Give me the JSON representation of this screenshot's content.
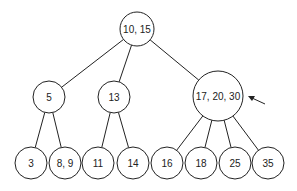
{
  "diagram": {
    "type": "2-3-4 tree",
    "nodes": [
      {
        "id": "root",
        "label": "10, 15",
        "cx": 137,
        "cy": 29,
        "r": 17
      },
      {
        "id": "n5",
        "label": "5",
        "cx": 49,
        "cy": 97,
        "r": 16
      },
      {
        "id": "n13",
        "label": "13",
        "cx": 114,
        "cy": 97,
        "r": 16
      },
      {
        "id": "n17",
        "label": "17, 20, 30",
        "cx": 218,
        "cy": 96,
        "r": 25
      },
      {
        "id": "l3",
        "label": "3",
        "cx": 31,
        "cy": 163,
        "r": 16
      },
      {
        "id": "l89",
        "label": "8, 9",
        "cx": 65,
        "cy": 163,
        "r": 16
      },
      {
        "id": "l11",
        "label": "11",
        "cx": 98,
        "cy": 163,
        "r": 16
      },
      {
        "id": "l14",
        "label": "14",
        "cx": 133,
        "cy": 163,
        "r": 16
      },
      {
        "id": "l16",
        "label": "16",
        "cx": 167,
        "cy": 163,
        "r": 16
      },
      {
        "id": "l18",
        "label": "18",
        "cx": 201,
        "cy": 163,
        "r": 16
      },
      {
        "id": "l25",
        "label": "25",
        "cx": 235,
        "cy": 163,
        "r": 16
      },
      {
        "id": "l35",
        "label": "35",
        "cx": 268,
        "cy": 163,
        "r": 16
      }
    ],
    "edges": [
      [
        "root",
        "n5"
      ],
      [
        "root",
        "n13"
      ],
      [
        "root",
        "n17"
      ],
      [
        "n5",
        "l3"
      ],
      [
        "n5",
        "l89"
      ],
      [
        "n13",
        "l11"
      ],
      [
        "n13",
        "l14"
      ],
      [
        "n17",
        "l16"
      ],
      [
        "n17",
        "l18"
      ],
      [
        "n17",
        "l25"
      ],
      [
        "n17",
        "l35"
      ]
    ],
    "arrow": {
      "points_to": "n17",
      "from": [
        265,
        104
      ],
      "to": [
        248,
        96
      ]
    }
  }
}
